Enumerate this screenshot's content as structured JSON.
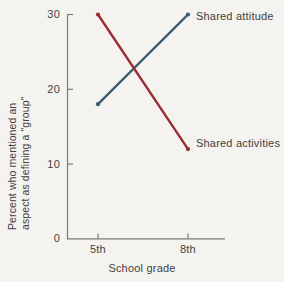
{
  "chart_data": {
    "type": "line",
    "title": "",
    "subtitle": "",
    "xlabel": "School grade",
    "ylabel": "Percent who mentioned an aspect as defining a \"group\"",
    "ylabel_lines": [
      "Percent who mentioned an",
      "aspect as defining a \"group\""
    ],
    "categories": [
      "5th",
      "8th"
    ],
    "x": [
      0,
      1
    ],
    "xtick_labels": [
      "5th",
      "8th"
    ],
    "ytick_labels": [
      "0",
      "10",
      "20",
      "30"
    ],
    "yticks": [
      0,
      10,
      20,
      30
    ],
    "ylim": [
      0,
      30
    ],
    "grid": false,
    "legend_position": "inline-right-of-line-ends",
    "series": [
      {
        "name": "Shared attitude",
        "values": [
          18,
          30
        ],
        "color": "#3c5c70",
        "marker": "dot"
      },
      {
        "name": "Shared activities",
        "values": [
          30,
          12
        ],
        "color": "#9d2b33",
        "marker": "dot"
      }
    ]
  },
  "axes": {
    "y_tick_labels": [
      "30",
      "20",
      "10",
      "0"
    ],
    "x_tick_labels": [
      "5th",
      "8th"
    ],
    "x_axis_title": "School grade"
  },
  "colors": {
    "background": "#f5f3ef",
    "axis": "#7a7a7a",
    "text": "#3f3f3f",
    "series_attitude": "#3c5c70",
    "series_activities": "#9d2b33"
  }
}
